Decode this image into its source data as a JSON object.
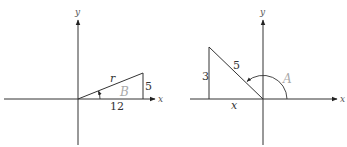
{
  "diagrams": [
    {
      "name": "left-triangle",
      "axes": {
        "x_label": "x",
        "y_label": "y"
      },
      "labels": {
        "hypotenuse": "r",
        "opposite": "5",
        "adjacent": "12",
        "angle": "B"
      }
    },
    {
      "name": "right-triangle",
      "axes": {
        "x_label": "x",
        "y_label": "y"
      },
      "labels": {
        "hypotenuse": "5",
        "opposite": "3",
        "adjacent": "x",
        "angle": "A"
      }
    }
  ],
  "colors": {
    "line": "#333333",
    "angle_label": "#aaaaaa"
  }
}
